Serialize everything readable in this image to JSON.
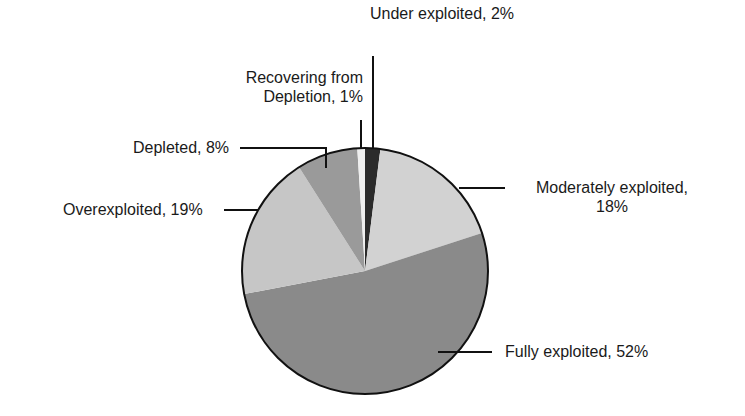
{
  "chart_data": {
    "type": "pie",
    "title": "",
    "start_angle": "top, clockwise",
    "slices": [
      {
        "label": "Under exploited",
        "value": 2,
        "color": "#2b2b2b"
      },
      {
        "label": "Moderately exploited",
        "value": 18,
        "color": "#d2d2d2"
      },
      {
        "label": "Fully exploited",
        "value": 52,
        "color": "#8a8a8a"
      },
      {
        "label": "Overexploited",
        "value": 19,
        "color": "#c6c6c6"
      },
      {
        "label": "Depleted",
        "value": 8,
        "color": "#9a9a9a"
      },
      {
        "label": "Recovering from Depletion",
        "value": 1,
        "color": "#efefef"
      }
    ]
  },
  "labels": {
    "under": "Under exploited, 2%",
    "recovering_line1": "Recovering from",
    "recovering_line2": "Depletion, 1%",
    "depleted": "Depleted, 8%",
    "overexploited": "Overexploited, 19%",
    "moderately_line1": "Moderately exploited,",
    "moderately_line2": "18%",
    "fully": "Fully exploited, 52%"
  }
}
